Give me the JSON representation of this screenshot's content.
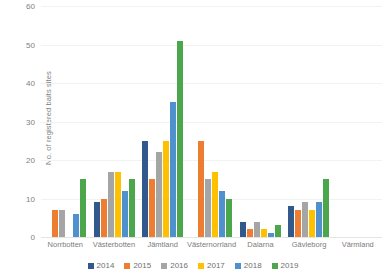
{
  "chart_data": {
    "type": "bar",
    "title": "",
    "subtitle": "",
    "xlabel": "",
    "ylabel": "No. of registered baits sites",
    "ylim": [
      0,
      60
    ],
    "yticks": [
      0,
      10,
      20,
      30,
      40,
      50,
      60
    ],
    "grid": true,
    "legend_position": "bottom",
    "categories": [
      "Norrbotten",
      "Västerbotten",
      "Jämtland",
      "Västernorrland",
      "Dalarna",
      "Gävleborg",
      "Värmland"
    ],
    "series": [
      {
        "name": "2014",
        "color": "#31598C",
        "values": [
          0,
          9,
          25,
          0,
          4,
          8,
          0
        ]
      },
      {
        "name": "2015",
        "color": "#ED7D31",
        "values": [
          7,
          10,
          15,
          25,
          2,
          7,
          0
        ]
      },
      {
        "name": "2016",
        "color": "#A5A5A5",
        "values": [
          7,
          17,
          22,
          15,
          4,
          9,
          0
        ]
      },
      {
        "name": "2017",
        "color": "#FFC000",
        "values": [
          0,
          17,
          25,
          17,
          2,
          7,
          0
        ]
      },
      {
        "name": "2018",
        "color": "#4E91CE",
        "values": [
          6,
          12,
          35,
          12,
          1,
          9,
          0
        ]
      },
      {
        "name": "2019",
        "color": "#4CA64C",
        "values": [
          15,
          15,
          51,
          10,
          3,
          15,
          0
        ]
      }
    ]
  }
}
